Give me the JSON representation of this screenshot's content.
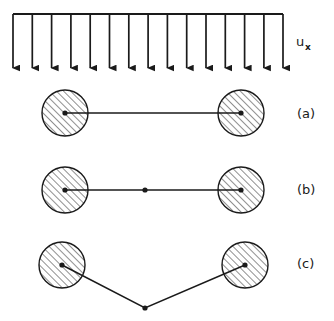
{
  "figure": {
    "background_color": "#ffffff",
    "line_color": "#1a1a1a",
    "hatch_color": "#333333",
    "width": 334,
    "height": 321
  },
  "load": {
    "label_main": "u",
    "label_subscript": "x",
    "label_full": "u_x",
    "label_x": 296,
    "label_y": 46,
    "sub_x": 305,
    "sub_y": 50,
    "arrow_count": 15,
    "bar_y": 14,
    "bar_x_start": 13,
    "bar_x_end": 283,
    "arrow_tip_y": 76,
    "arrow_xs": [
      13,
      32.3,
      51.6,
      70.9,
      90.2,
      109.5,
      128.8,
      148.1,
      167.4,
      186.7,
      206.0,
      225.3,
      244.6,
      263.9,
      283
    ]
  },
  "cases": [
    {
      "id": "a",
      "label": "(a)",
      "label_x": 297,
      "label_y": 118,
      "circle_radius": 23,
      "node_dot_radius": 2.6,
      "left_circle": {
        "cx": 65,
        "cy": 113
      },
      "right_circle": {
        "cx": 241,
        "cy": 113
      },
      "nodes": [
        {
          "x": 65,
          "y": 113
        },
        {
          "x": 241,
          "y": 113
        }
      ],
      "polyline": "65,113 241,113",
      "middle_node": null
    },
    {
      "id": "b",
      "label": "(b)",
      "label_x": 297,
      "label_y": 194,
      "circle_radius": 23,
      "node_dot_radius": 2.6,
      "left_circle": {
        "cx": 65,
        "cy": 190
      },
      "right_circle": {
        "cx": 241,
        "cy": 190
      },
      "nodes": [
        {
          "x": 65,
          "y": 190
        },
        {
          "x": 145,
          "y": 190
        },
        {
          "x": 241,
          "y": 190
        }
      ],
      "polyline": "65,190 145,190 241,190",
      "middle_node": {
        "x": 145,
        "y": 190
      }
    },
    {
      "id": "c",
      "label": "(c)",
      "label_x": 297,
      "label_y": 268,
      "circle_radius": 23,
      "node_dot_radius": 2.6,
      "left_circle": {
        "cx": 62,
        "cy": 265
      },
      "right_circle": {
        "cx": 245,
        "cy": 265
      },
      "nodes": [
        {
          "x": 62,
          "y": 265
        },
        {
          "x": 145,
          "y": 308
        },
        {
          "x": 245,
          "y": 265
        }
      ],
      "polyline": "62,265 145,308 245,265",
      "middle_node": {
        "x": 145,
        "y": 308
      }
    }
  ]
}
